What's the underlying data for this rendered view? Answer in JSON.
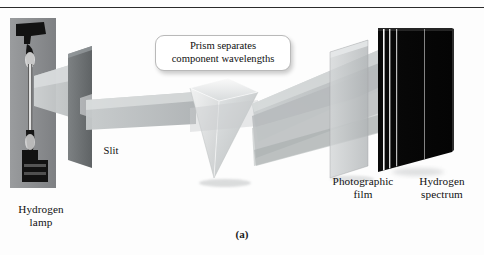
{
  "figure": {
    "caption": "(a)",
    "topic": "Hydrogen emission line spectrum apparatus"
  },
  "callout": {
    "line1": "Prism separates",
    "line2": "component wavelengths"
  },
  "labels": {
    "slit": "Slit",
    "lamp_line1": "Hydrogen",
    "lamp_line2": "lamp",
    "film_line1": "Photographic",
    "film_line2": "film",
    "spectrum_line1": "Hydrogen",
    "spectrum_line2": "spectrum"
  },
  "components": {
    "lamp": "hydrogen-discharge-lamp-photo",
    "slit": "slit-screen",
    "prism": "triangular-glass-prism",
    "film": "photographic-film-panel",
    "plate": "exposed-spectrum-plate"
  },
  "colors": {
    "background": "#fdfdfd",
    "rule": "#2b2b2b",
    "beam": "#b9bcbd",
    "beam_light": "#d2d5d6",
    "slit_screen": "#6e7375",
    "prism_face": "#e3e5e6",
    "film_panel": "#c4c8c9",
    "plate_black": "#070707",
    "spectrum_line": "#ffffff",
    "lamp_backdrop": "#8f9193",
    "lamp_body": "#151515",
    "callout_border": "#b9b9b9",
    "text": "#101010"
  },
  "spectrum_lines": [
    {
      "name": "line-1",
      "x_pct": 6,
      "width": 1.6
    },
    {
      "name": "line-2",
      "x_pct": 13,
      "width": 1.4
    },
    {
      "name": "line-3",
      "x_pct": 21,
      "width": 1.2
    },
    {
      "name": "line-4",
      "x_pct": 62,
      "width": 1.0
    }
  ]
}
